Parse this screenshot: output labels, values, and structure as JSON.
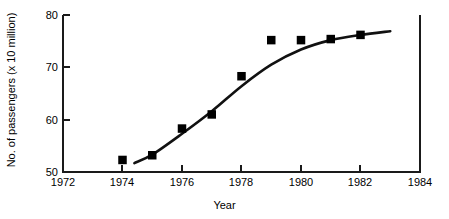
{
  "chart_data": {
    "type": "scatter",
    "title": "",
    "xlabel": "Year",
    "ylabel": "No. of passengers (x 10 million)",
    "xlim": [
      1972,
      1984
    ],
    "ylim": [
      50,
      80
    ],
    "xticks": [
      1972,
      1974,
      1976,
      1978,
      1980,
      1982,
      1984
    ],
    "yticks": [
      50,
      60,
      70,
      80
    ],
    "xtick_labels": [
      "1972",
      "1974",
      "1976",
      "1978",
      "1980",
      "1982",
      "1984"
    ],
    "ytick_labels": [
      "50",
      "60",
      "70",
      "80"
    ],
    "grid": false,
    "legend": false,
    "marker_style": "filled-square",
    "marker_color": "#000000",
    "line_color": "#000000",
    "x": [
      1974,
      1975,
      1976,
      1977,
      1978,
      1979,
      1980,
      1981,
      1982
    ],
    "values": [
      52.3,
      53.2,
      58.3,
      61.0,
      68.3,
      75.2,
      75.2,
      75.4,
      76.2
    ],
    "series": [
      {
        "name": "No. of passengers",
        "x": [
          1974,
          1975,
          1976,
          1977,
          1978,
          1979,
          1980,
          1981,
          1982
        ],
        "values": [
          52.3,
          53.2,
          58.3,
          61.0,
          68.3,
          75.2,
          75.2,
          75.4,
          76.2
        ]
      }
    ],
    "fit_curve": {
      "name": "fitted trend line",
      "x": [
        1974.4,
        1975.0,
        1976.0,
        1977.0,
        1978.0,
        1979.0,
        1980.0,
        1981.0,
        1982.0,
        1983.0
      ],
      "values": [
        51.7,
        53.3,
        57.3,
        61.6,
        66.4,
        70.5,
        73.4,
        75.2,
        76.2,
        76.9
      ]
    }
  },
  "axes": {
    "x_title": "Year",
    "y_title": "No. of passengers (x 10 million)"
  }
}
